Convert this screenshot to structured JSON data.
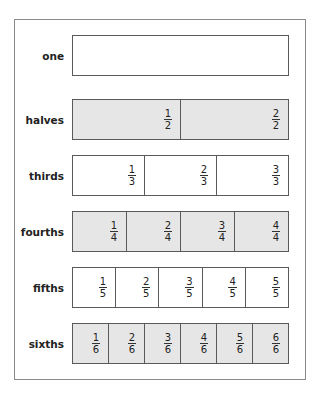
{
  "diagram": {
    "title": "",
    "fill_color": "#e6e6e6",
    "border_color": "#5a5a5a",
    "rows": [
      {
        "label": "one",
        "denominator": 1,
        "shaded": false,
        "cells": []
      },
      {
        "label": "halves",
        "denominator": 2,
        "shaded": true,
        "cells": [
          {
            "num": "1",
            "den": "2"
          },
          {
            "num": "2",
            "den": "2"
          }
        ]
      },
      {
        "label": "thirds",
        "denominator": 3,
        "shaded": false,
        "cells": [
          {
            "num": "1",
            "den": "3"
          },
          {
            "num": "2",
            "den": "3"
          },
          {
            "num": "3",
            "den": "3"
          }
        ]
      },
      {
        "label": "fourths",
        "denominator": 4,
        "shaded": true,
        "cells": [
          {
            "num": "1",
            "den": "4"
          },
          {
            "num": "2",
            "den": "4"
          },
          {
            "num": "3",
            "den": "4"
          },
          {
            "num": "4",
            "den": "4"
          }
        ]
      },
      {
        "label": "fifths",
        "denominator": 5,
        "shaded": false,
        "cells": [
          {
            "num": "1",
            "den": "5"
          },
          {
            "num": "2",
            "den": "5"
          },
          {
            "num": "3",
            "den": "5"
          },
          {
            "num": "4",
            "den": "5"
          },
          {
            "num": "5",
            "den": "5"
          }
        ]
      },
      {
        "label": "sixths",
        "denominator": 6,
        "shaded": true,
        "cells": [
          {
            "num": "1",
            "den": "6"
          },
          {
            "num": "2",
            "den": "6"
          },
          {
            "num": "3",
            "den": "6"
          },
          {
            "num": "4",
            "den": "6"
          },
          {
            "num": "5",
            "den": "6"
          },
          {
            "num": "6",
            "den": "6"
          }
        ]
      }
    ]
  }
}
